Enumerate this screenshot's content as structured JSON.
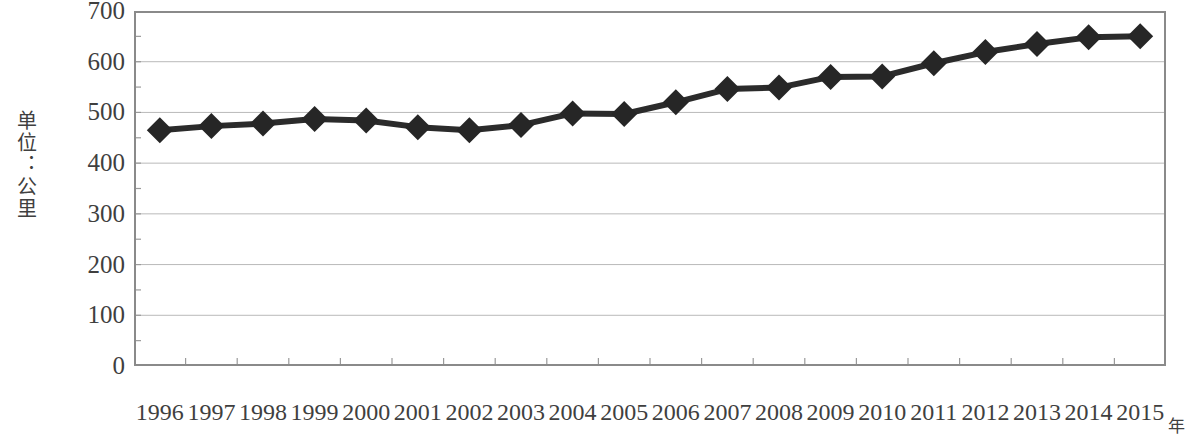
{
  "chart_data": {
    "type": "line",
    "title": "",
    "xlabel": "年",
    "ylabel": "单位：公里",
    "categories": [
      "1996",
      "1997",
      "1998",
      "1999",
      "2000",
      "2001",
      "2002",
      "2003",
      "2004",
      "2005",
      "2006",
      "2007",
      "2008",
      "2009",
      "2010",
      "2011",
      "2012",
      "2013",
      "2014",
      "2015"
    ],
    "values": [
      465,
      473,
      478,
      487,
      484,
      471,
      465,
      475,
      498,
      497,
      520,
      546,
      549,
      570,
      571,
      597,
      619,
      635,
      648,
      650
    ],
    "series": [
      {
        "name": "公里",
        "values": [
          465,
          473,
          478,
          487,
          484,
          471,
          465,
          475,
          498,
          497,
          520,
          546,
          549,
          570,
          571,
          597,
          619,
          635,
          648,
          650
        ]
      }
    ],
    "ylim": [
      0,
      700
    ],
    "yticks": [
      0,
      100,
      200,
      300,
      400,
      500,
      600,
      700
    ],
    "ytick_labels": [
      "0",
      "100",
      "200",
      "300",
      "400",
      "500",
      "600",
      "700"
    ],
    "grid": true,
    "grid_axis": "y",
    "legend": false,
    "marker": "diamond",
    "line_color": "#2b2b2b",
    "marker_color": "#262626",
    "grid_color": "#b9b9b9",
    "border_color": "#8a8a8a",
    "background": "#ffffff"
  }
}
